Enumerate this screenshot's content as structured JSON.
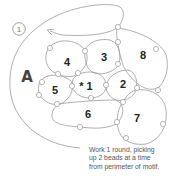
{
  "diagram": {
    "step_number": "1",
    "figure_label": "A",
    "regions": [
      {
        "id": "1",
        "label": "* 1"
      },
      {
        "id": "2",
        "label": "2"
      },
      {
        "id": "3",
        "label": "3"
      },
      {
        "id": "4",
        "label": "4"
      },
      {
        "id": "5",
        "label": "5"
      },
      {
        "id": "6",
        "label": "6"
      },
      {
        "id": "7",
        "label": "7"
      },
      {
        "id": "8",
        "label": "8"
      }
    ],
    "caption": {
      "line1": "Work 1 round, picking",
      "line2": "up 2 beads at a time",
      "line3": "from perimeter of motif."
    },
    "colors": {
      "thread": "#9a9a9a",
      "text": "#222222",
      "caption": "#555555"
    }
  }
}
